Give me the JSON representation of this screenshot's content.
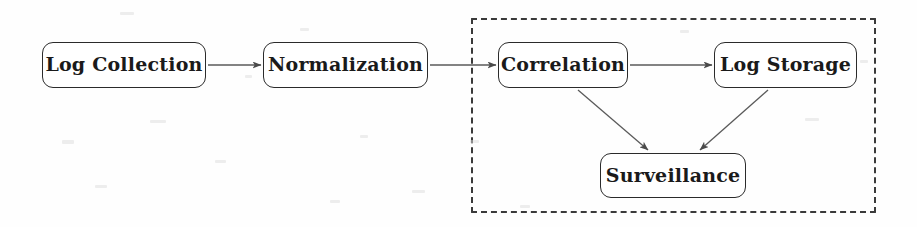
{
  "diagram": {
    "background_color": "#fefefe",
    "stroke_color": "#2b2b2b",
    "text_color": "#1a1a1a",
    "group": {
      "label": "",
      "style": "dashed",
      "border_color": "#3a3a3a",
      "x": 471,
      "y": 18,
      "width": 405,
      "height": 195
    },
    "nodes": [
      {
        "id": "log-collection",
        "label": "Log Collection",
        "x": 42,
        "y": 42,
        "width": 164,
        "height": 46,
        "in_group": false
      },
      {
        "id": "normalization",
        "label": "Normalization",
        "x": 263,
        "y": 42,
        "width": 165,
        "height": 46,
        "in_group": false
      },
      {
        "id": "correlation",
        "label": "Correlation",
        "x": 498,
        "y": 42,
        "width": 130,
        "height": 46,
        "in_group": true
      },
      {
        "id": "log-storage",
        "label": "Log Storage",
        "x": 714,
        "y": 42,
        "width": 143,
        "height": 46,
        "in_group": true
      },
      {
        "id": "surveillance",
        "label": "Surveillance",
        "x": 600,
        "y": 153,
        "width": 146,
        "height": 45,
        "in_group": true
      }
    ],
    "edges": [
      {
        "id": "e1",
        "from": "log-collection",
        "to": "normalization",
        "kind": "horizontal",
        "x1": 208,
        "y1": 65,
        "x2": 261,
        "y2": 65
      },
      {
        "id": "e2",
        "from": "normalization",
        "to": "correlation",
        "kind": "horizontal",
        "x1": 430,
        "y1": 65,
        "x2": 496,
        "y2": 65
      },
      {
        "id": "e3",
        "from": "correlation",
        "to": "log-storage",
        "kind": "horizontal",
        "x1": 630,
        "y1": 65,
        "x2": 712,
        "y2": 65
      },
      {
        "id": "e4",
        "from": "correlation",
        "to": "surveillance",
        "kind": "diagonal",
        "x1": 578,
        "y1": 90,
        "x2": 648,
        "y2": 150
      },
      {
        "id": "e5",
        "from": "log-storage",
        "to": "surveillance",
        "kind": "diagonal",
        "x1": 768,
        "y1": 90,
        "x2": 700,
        "y2": 150
      }
    ]
  }
}
